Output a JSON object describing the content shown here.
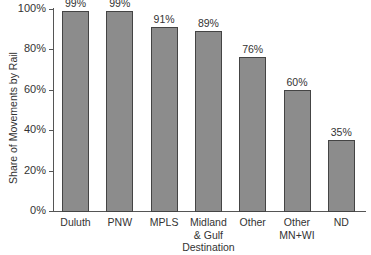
{
  "chart_data": {
    "type": "bar",
    "title": "",
    "xlabel": "",
    "ylabel": "Share of Movements by Rail",
    "categories": [
      "Duluth",
      "PNW",
      "MPLS",
      "Midland & Gulf Destination",
      "Other",
      "Other MN+WI",
      "ND"
    ],
    "category_display": [
      "Duluth",
      "PNW",
      "MPLS",
      "Midland\n& Gulf\nDestination",
      "Other",
      "Other\nMN+WI",
      "ND"
    ],
    "values": [
      99,
      99,
      91,
      89,
      76,
      60,
      35
    ],
    "value_labels": [
      "99%",
      "99%",
      "91%",
      "89%",
      "76%",
      "60%",
      "35%"
    ],
    "ylim": [
      0,
      100
    ],
    "yticks": [
      0,
      20,
      40,
      60,
      80,
      100
    ],
    "ytick_labels": [
      "0%",
      "20%",
      "40%",
      "60%",
      "80%",
      "100%"
    ],
    "grid": false,
    "legend": null,
    "colors": {
      "bar_fill": "#8c8c8c",
      "bar_edge": "#444444",
      "axis": "#555555"
    }
  }
}
